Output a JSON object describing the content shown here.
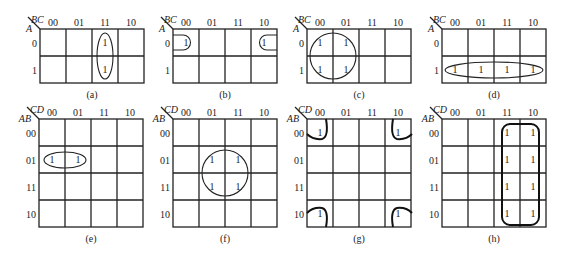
{
  "figure": {
    "background": "#ffffff",
    "ink_color": "#222222"
  },
  "kmaps": [
    {
      "id": "a",
      "caption": "(a)",
      "var_col": "BC",
      "var_row": "A",
      "col_labels": [
        "00",
        "01",
        "11",
        "10"
      ],
      "row_labels": [
        "0",
        "1"
      ],
      "x": 40,
      "y": 29,
      "cell_w": 26,
      "cell_h": 27,
      "ones": [
        [
          0,
          2
        ],
        [
          1,
          2
        ]
      ],
      "loops": [
        {
          "type": "ellipse",
          "cx": 105,
          "cy": 56,
          "rx": 8,
          "ry": 23
        }
      ]
    },
    {
      "id": "b",
      "caption": "(b)",
      "var_col": "BC",
      "var_row": "A",
      "col_labels": [
        "00",
        "01",
        "11",
        "10"
      ],
      "row_labels": [
        "0",
        "1"
      ],
      "x": 173,
      "y": 29,
      "cell_w": 26,
      "cell_h": 27,
      "ones": [
        [
          0,
          0
        ],
        [
          0,
          3
        ]
      ],
      "loops": [
        {
          "type": "path",
          "d": "M173,35 L183,35 A7.5,7.5 0 0 1 183,50 L173,50"
        },
        {
          "type": "path",
          "d": "M277,35 L267,35 A7.5,7.5 0 0 0 267,50 L277,50"
        }
      ]
    },
    {
      "id": "c",
      "caption": "(c)",
      "var_col": "BC",
      "var_row": "A",
      "col_labels": [
        "00",
        "01",
        "11",
        "10"
      ],
      "row_labels": [
        "0",
        "1"
      ],
      "x": 307,
      "y": 29,
      "cell_w": 26,
      "cell_h": 27,
      "ones": [
        [
          0,
          0
        ],
        [
          0,
          1
        ],
        [
          1,
          0
        ],
        [
          1,
          1
        ]
      ],
      "loops": [
        {
          "type": "circle",
          "cx": 333,
          "cy": 56,
          "r": 23
        }
      ]
    },
    {
      "id": "d",
      "caption": "(d)",
      "var_col": "BC",
      "var_row": "A",
      "col_labels": [
        "00",
        "01",
        "11",
        "10"
      ],
      "row_labels": [
        "0",
        "1"
      ],
      "x": 442,
      "y": 29,
      "cell_w": 26,
      "cell_h": 27,
      "ones": [
        [
          1,
          0
        ],
        [
          1,
          1
        ],
        [
          1,
          2
        ],
        [
          1,
          3
        ]
      ],
      "loops": [
        {
          "type": "ellipse",
          "cx": 494,
          "cy": 70,
          "rx": 49,
          "ry": 8
        }
      ]
    },
    {
      "id": "e",
      "caption": "(e)",
      "var_col": "CD",
      "var_row": "AB",
      "col_labels": [
        "00",
        "01",
        "11",
        "10"
      ],
      "row_labels": [
        "00",
        "01",
        "11",
        "10"
      ],
      "x": 39,
      "y": 119,
      "cell_w": 26,
      "cell_h": 27,
      "ones": [
        [
          1,
          0
        ],
        [
          1,
          1
        ]
      ],
      "loops": [
        {
          "type": "ellipse",
          "cx": 65,
          "cy": 160,
          "rx": 21,
          "ry": 8
        }
      ]
    },
    {
      "id": "f",
      "caption": "(f)",
      "var_col": "CD",
      "var_row": "AB",
      "col_labels": [
        "00",
        "01",
        "11",
        "10"
      ],
      "row_labels": [
        "00",
        "01",
        "11",
        "10"
      ],
      "x": 173,
      "y": 119,
      "cell_w": 26,
      "cell_h": 27,
      "ones": [
        [
          1,
          1
        ],
        [
          1,
          2
        ],
        [
          2,
          1
        ],
        [
          2,
          2
        ]
      ],
      "loops": [
        {
          "type": "circle",
          "cx": 225,
          "cy": 173,
          "r": 23
        }
      ]
    },
    {
      "id": "g",
      "caption": "(g)",
      "var_col": "CD",
      "var_row": "AB",
      "col_labels": [
        "00",
        "01",
        "11",
        "10"
      ],
      "row_labels": [
        "00",
        "01",
        "11",
        "10"
      ],
      "x": 307,
      "y": 119,
      "cell_w": 26,
      "cell_h": 27,
      "ones": [
        [
          0,
          0
        ],
        [
          0,
          3
        ],
        [
          3,
          0
        ],
        [
          3,
          3
        ]
      ],
      "loops": [
        {
          "type": "thick",
          "d": "M307,134 Q313,140 322,139 Q329,137 326,119"
        },
        {
          "type": "thick",
          "d": "M412,134 Q406,140 397,139 Q390,137 393,119"
        },
        {
          "type": "thick",
          "d": "M307,213 Q313,207 322,208 Q329,210 326,227"
        },
        {
          "type": "thick",
          "d": "M412,213 Q406,207 397,208 Q390,210 393,227"
        }
      ]
    },
    {
      "id": "h",
      "caption": "(h)",
      "var_col": "CD",
      "var_row": "AB",
      "col_labels": [
        "00",
        "01",
        "11",
        "10"
      ],
      "row_labels": [
        "00",
        "01",
        "11",
        "10"
      ],
      "x": 442,
      "y": 119,
      "cell_w": 26,
      "cell_h": 27,
      "ones": [
        [
          0,
          2
        ],
        [
          0,
          3
        ],
        [
          1,
          2
        ],
        [
          1,
          3
        ],
        [
          2,
          2
        ],
        [
          2,
          3
        ],
        [
          3,
          2
        ],
        [
          3,
          3
        ]
      ],
      "loops": [
        {
          "type": "rrect",
          "x": 502,
          "y": 124,
          "w": 37,
          "h": 101,
          "r": 8
        }
      ]
    }
  ]
}
